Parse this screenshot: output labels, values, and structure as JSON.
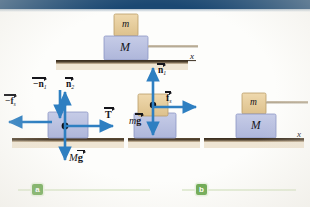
{
  "figure": {
    "type": "physics-free-body-diagram",
    "banner_color": "#1b4872",
    "block_small_color": "#e8cfa0",
    "block_large_color": "#b9c0e0",
    "arrow_color": "#2e7fc1",
    "surface_color": "#4a3c2a",
    "badge_color": "#6aa84f"
  },
  "panel_top": {
    "block_small_label": "m",
    "block_large_label": "M",
    "axis_label": "x"
  },
  "fbd_large": {
    "normal_down_label": "−n",
    "normal_down_sub": "1",
    "normal_up_label": "n",
    "normal_up_sub": "2",
    "friction_label": "−f",
    "friction_sub": "s",
    "tension_label": "T",
    "weight_prefix": "M",
    "weight_label": "g"
  },
  "fbd_small": {
    "normal_label": "n",
    "normal_sub": "1",
    "friction_label": "f",
    "friction_sub": "s",
    "weight_prefix": "m",
    "weight_label": "g"
  },
  "panel_b": {
    "block_small_label": "m",
    "block_large_label": "M",
    "axis_label": "x"
  },
  "captions": {
    "a": "a",
    "b": "b"
  }
}
